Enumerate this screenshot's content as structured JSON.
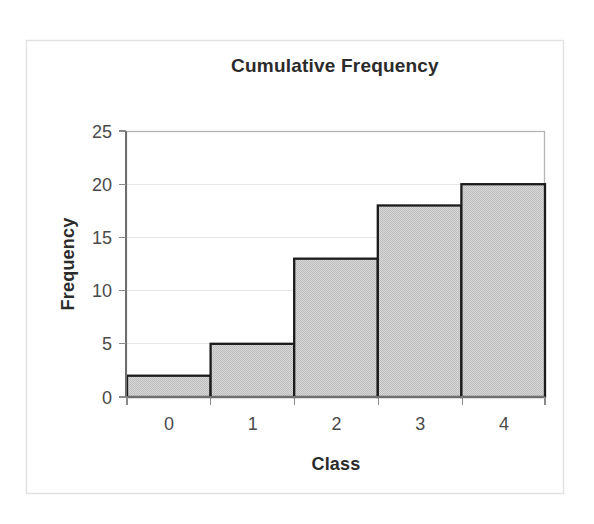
{
  "chart_data": {
    "type": "bar",
    "title": "Cumulative Frequency",
    "xlabel": "Class",
    "ylabel": "Frequency",
    "categories": [
      "0",
      "1",
      "2",
      "3",
      "4"
    ],
    "values": [
      2,
      5,
      13,
      18,
      20
    ],
    "series": [
      {
        "name": "Cumulative Frequency",
        "values": [
          2,
          5,
          13,
          18,
          20
        ]
      }
    ],
    "ylim": [
      0,
      25
    ],
    "yticks": [
      "0",
      "5",
      "10",
      "15",
      "20",
      "25"
    ],
    "ytick_values": [
      0,
      5,
      10,
      15,
      20,
      25
    ],
    "xticks": [
      "0",
      "1",
      "2",
      "3",
      "4"
    ],
    "grid": "horizontal",
    "legend": "none",
    "bar_gap": 0,
    "colors": {
      "bar_fill": "#c8c8c8",
      "bar_edge": "#1b1b1b",
      "gridline": "#e6e6e6",
      "plot_frame": "#b4b4b4",
      "axis_line": "#6e6e6e",
      "text": "#2b2b2b",
      "tick_text": "#4a4a4a",
      "outer_frame": "#e2e2e2",
      "background": "#ffffff"
    }
  }
}
